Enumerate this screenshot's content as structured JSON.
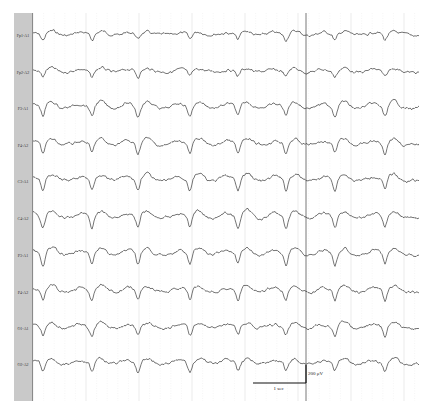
{
  "chart_data": {
    "type": "line",
    "title": "",
    "xlabel": "Time",
    "ylabel": "Amplitude",
    "grid": true,
    "channels": [
      "Fp1-A1",
      "Fp2-A2",
      "F3-A1",
      "F4-A2",
      "C3-A1",
      "C4-A2",
      "P3-A1",
      "P4-A2",
      "O1-A1",
      "O2-A2"
    ],
    "channel_y": [
      35,
      72,
      108,
      145,
      181,
      218,
      255,
      292,
      328,
      364
    ],
    "sharp_wave_x": [
      46,
      95,
      141,
      193,
      241,
      289,
      338,
      388
    ],
    "amplitude_scale": [
      4,
      4,
      7,
      7,
      8,
      8,
      8,
      7,
      6,
      6
    ],
    "scale_bar": {
      "time_label": "1 sec",
      "amplitude_label": "200 μV",
      "time_px": 53,
      "amplitude_px": 18
    },
    "marker_line_x": 306
  },
  "colors": {
    "trace": "#3a3a3a",
    "grid_minor": "#ececec",
    "grid_major": "#d6d6d6",
    "marker": "#555555",
    "label_bg": "#c9c9c9"
  }
}
